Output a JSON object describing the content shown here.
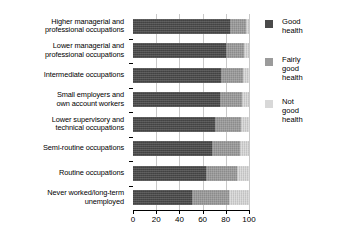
{
  "chart_data": {
    "type": "bar",
    "orientation": "horizontal",
    "stacked": true,
    "title": "",
    "xlabel": "",
    "ylabel": "",
    "xlim": [
      0,
      100
    ],
    "xticks": [
      0,
      20,
      40,
      60,
      80,
      100
    ],
    "xtick_labels": [
      "0",
      "20",
      "40",
      "60",
      "80",
      "100"
    ],
    "grid": true,
    "legend_position": "right",
    "categories": [
      "Higher managerial and professional occupations",
      "Lower managerial and professional occupations",
      "Intermediate occupations",
      "Small employers and own account workers",
      "Lower supervisory and technical occupations",
      "Semi-routine occupations",
      "Routine occupations",
      "Never worked/long-term unemployed"
    ],
    "category_lines": [
      [
        "Higher managerial and",
        "professional occupations"
      ],
      [
        "Lower managerial and",
        "professional occupations"
      ],
      [
        "Intermediate occupations"
      ],
      [
        "Small employers and",
        "own account workers"
      ],
      [
        "Lower supervisory and",
        "technical occupations"
      ],
      [
        "Semi-routine occupations"
      ],
      [
        "Routine occupations"
      ],
      [
        "Never worked/long-term",
        "unemployed"
      ]
    ],
    "series": [
      {
        "name": "Good health",
        "color": "#4a4a4a",
        "values": [
          84,
          80,
          76,
          75,
          71,
          68,
          63,
          51
        ]
      },
      {
        "name": "Fairly good health",
        "color": "#9b9b9b",
        "values": [
          13,
          16,
          19,
          19,
          22,
          24,
          27,
          32
        ]
      },
      {
        "name": "Not good health",
        "color": "#d8d8d8",
        "values": [
          3,
          4,
          5,
          6,
          7,
          8,
          10,
          17
        ]
      }
    ]
  },
  "legend": {
    "items": [
      {
        "label_lines": [
          "Good",
          "health"
        ],
        "color": "#4a4a4a"
      },
      {
        "label_lines": [
          "Fairly",
          "good",
          "health"
        ],
        "color": "#9b9b9b"
      },
      {
        "label_lines": [
          "Not",
          "good",
          "health"
        ],
        "color": "#d8d8d8"
      }
    ]
  }
}
